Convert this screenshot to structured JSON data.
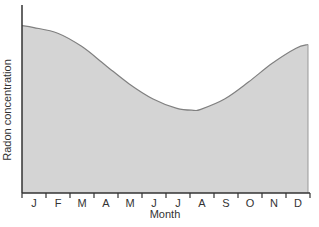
{
  "chart_data": {
    "type": "area",
    "title": "",
    "xlabel": "Month",
    "ylabel": "Radon concentration",
    "categories": [
      "J",
      "F",
      "M",
      "A",
      "M",
      "J",
      "J",
      "A",
      "S",
      "O",
      "N",
      "D"
    ],
    "series": [
      {
        "name": "Radon concentration",
        "x": [
          0,
          0.5,
          1.5,
          2.5,
          3.5,
          4.5,
          5.5,
          6.5,
          7.2,
          7.5,
          8.5,
          9.5,
          10.5,
          11.5,
          11.9
        ],
        "values": [
          89,
          88,
          85,
          78,
          68,
          58,
          50,
          45,
          44,
          44.5,
          50,
          59,
          69,
          77,
          79
        ]
      }
    ],
    "xlim": [
      0,
      12
    ],
    "ylim": [
      0,
      100
    ],
    "y_ticks": false,
    "grid": false,
    "legend": "none",
    "colors": {
      "fill": "#d4d4d4",
      "line": "#808080",
      "axis": "#333333"
    }
  }
}
